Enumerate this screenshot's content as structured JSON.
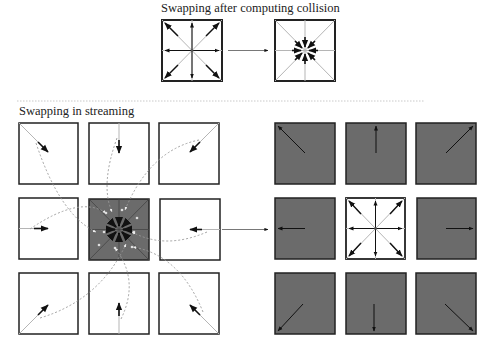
{
  "sections": {
    "top": {
      "title": "Swapping after computing collision"
    },
    "bottom": {
      "title": "Swapping in streaming"
    }
  },
  "colors": {
    "box_border": "#222222",
    "box_fill_white": "#ffffff",
    "box_fill_dark": "#6b6b6b",
    "lattice_line": "#b5b5b5",
    "arrow": "#111111",
    "dashed_curve": "#999999",
    "divider": "#bbbbbb"
  },
  "lattice": {
    "model": "D2Q9",
    "directions": [
      "E",
      "NE",
      "N",
      "NW",
      "W",
      "SW",
      "S",
      "SE"
    ]
  },
  "top_diagram": {
    "before": {
      "state": "post-collision populations pointing outward",
      "fill": "white"
    },
    "after": {
      "state": "populations swapped to point inward (star)",
      "fill": "white"
    },
    "connector": "arrow"
  },
  "streaming_diagram": {
    "left_grid": {
      "center": {
        "fill": "dark",
        "state": "swapped inward"
      },
      "neighbors": [
        {
          "pos": "NW",
          "arrow": "SE",
          "fill": "white"
        },
        {
          "pos": "N",
          "arrow": "S",
          "fill": "white"
        },
        {
          "pos": "NE",
          "arrow": "SW",
          "fill": "white"
        },
        {
          "pos": "W",
          "arrow": "E",
          "fill": "white"
        },
        {
          "pos": "E",
          "arrow": "W",
          "fill": "white"
        },
        {
          "pos": "SW",
          "arrow": "NE",
          "fill": "white"
        },
        {
          "pos": "S",
          "arrow": "N",
          "fill": "white"
        },
        {
          "pos": "SE",
          "arrow": "NW",
          "fill": "white"
        }
      ]
    },
    "right_grid": {
      "center": {
        "fill": "white",
        "state": "outward populations"
      },
      "neighbors": [
        {
          "pos": "NW",
          "arrow": "NW",
          "fill": "dark"
        },
        {
          "pos": "N",
          "arrow": "N",
          "fill": "dark"
        },
        {
          "pos": "NE",
          "arrow": "NE",
          "fill": "dark"
        },
        {
          "pos": "W",
          "arrow": "W",
          "fill": "dark"
        },
        {
          "pos": "E",
          "arrow": "E",
          "fill": "dark"
        },
        {
          "pos": "SW",
          "arrow": "SW",
          "fill": "dark"
        },
        {
          "pos": "S",
          "arrow": "S",
          "fill": "dark"
        },
        {
          "pos": "SE",
          "arrow": "SE",
          "fill": "dark"
        }
      ]
    },
    "connector": "arrow"
  }
}
